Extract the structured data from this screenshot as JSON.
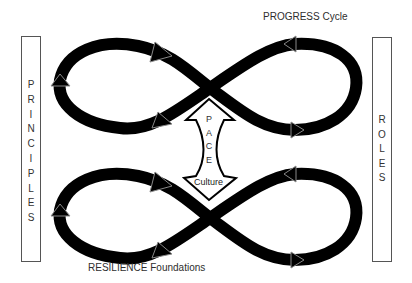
{
  "diagram": {
    "top_label": "PROGRESS Cycle",
    "bottom_label": "RESILIENCE Foundations",
    "left_box": {
      "label": "PRINCIPLES",
      "letters": [
        "P",
        "R",
        "I",
        "N",
        "C",
        "I",
        "P",
        "L",
        "E",
        "S"
      ]
    },
    "right_box": {
      "label": "ROLES",
      "letters": [
        "R",
        "O",
        "L",
        "E",
        "S"
      ]
    },
    "center_shape": {
      "label": "PACE",
      "letters": [
        "P",
        "A",
        "C",
        "E"
      ],
      "base_label": "Culture"
    },
    "loops": [
      {
        "name": "upper-infinity-loop",
        "shape": "figure-eight",
        "arrowheads": 6
      },
      {
        "name": "lower-infinity-loop",
        "shape": "figure-eight",
        "arrowheads": 6
      }
    ],
    "colors": {
      "loop_fill": "#000000",
      "box_border": "#555555",
      "text": "#333333",
      "background": "#ffffff"
    }
  }
}
